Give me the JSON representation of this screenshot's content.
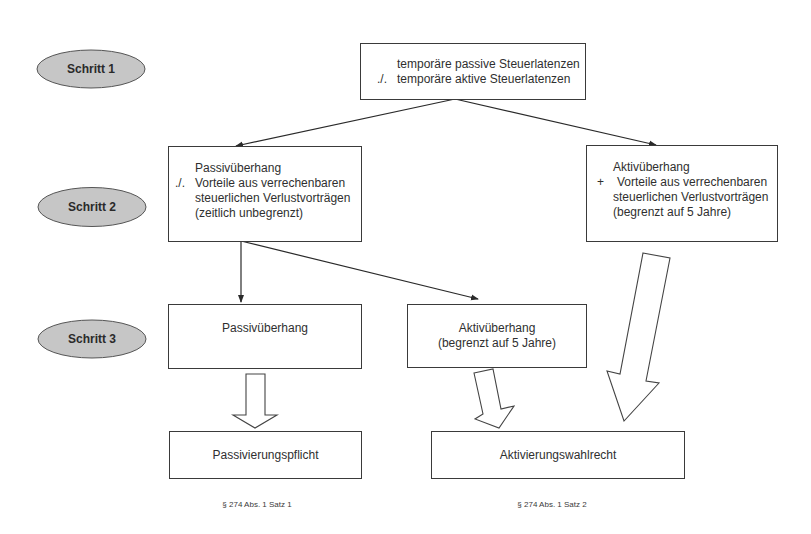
{
  "steps": [
    {
      "label": "Schritt 1"
    },
    {
      "label": "Schritt 2"
    },
    {
      "label": "Schritt 3"
    }
  ],
  "colors": {
    "step_fill": "#c6c6c6",
    "stroke": "#3a3a3a",
    "background": "#ffffff"
  },
  "box_top": {
    "lines": [
      {
        "prefix": "",
        "text": "temporäre passive Steuerlatenzen"
      },
      {
        "prefix": "./.",
        "text": "temporäre aktive Steuerlatenzen"
      }
    ]
  },
  "box_passiv_step2": {
    "lines": [
      {
        "prefix": "",
        "text": "Passivüberhang"
      },
      {
        "prefix": "./.",
        "text": "Vorteile aus verrechenbaren"
      },
      {
        "prefix": "",
        "text": "steuerlichen Verlustvorträgen"
      },
      {
        "prefix": "",
        "text": "(zeitlich unbegrenzt)"
      }
    ]
  },
  "box_aktiv_step2": {
    "lines": [
      {
        "prefix": "",
        "text": "Aktivüberhang"
      },
      {
        "prefix": "+",
        "text": "Vorteile aus verrechenbaren"
      },
      {
        "prefix": "",
        "text": "steuerlichen Verlustvorträgen"
      },
      {
        "prefix": "",
        "text": "(begrenzt auf 5 Jahre)"
      }
    ]
  },
  "box_passiv_step3": {
    "line1": "Passivüberhang"
  },
  "box_aktiv_step3": {
    "line1": "Aktivüberhang",
    "line2": "(begrenzt auf 5 Jahre)"
  },
  "box_passivierungspflicht": {
    "label": "Passivierungspflicht"
  },
  "box_aktivierungswahlrecht": {
    "label": "Aktivierungswahlrecht"
  },
  "footnotes": [
    {
      "text": "§ 274 Abs. 1 Satz 1"
    },
    {
      "text": "§ 274 Abs. 1 Satz 2"
    }
  ]
}
